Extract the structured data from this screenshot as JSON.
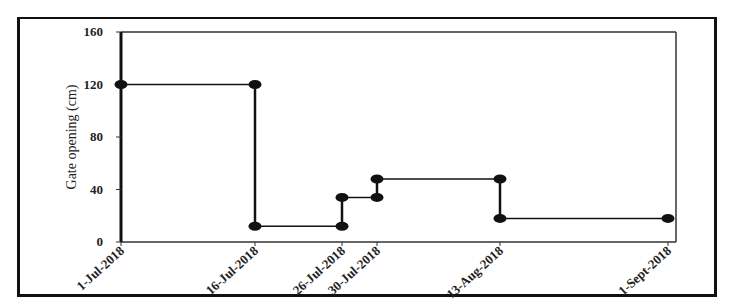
{
  "chart_data": {
    "type": "line",
    "subtype": "step",
    "title": "",
    "xlabel": "",
    "ylabel": "Gate opening (cm)",
    "ylim": [
      0,
      160
    ],
    "yticks": [
      0,
      40,
      80,
      120,
      160
    ],
    "categories": [
      "1-Jul-2018",
      "16-Jul-2018",
      "26-Jul-2018",
      "30-Jul-2018",
      "13-Aug-2018",
      "1-Sept-2018"
    ],
    "x_positions_days": [
      0,
      15,
      25,
      29,
      43,
      62
    ],
    "points": [
      {
        "x": "1-Jul-2018",
        "y": 120
      },
      {
        "x": "16-Jul-2018",
        "y": 120
      },
      {
        "x": "16-Jul-2018",
        "y": 12
      },
      {
        "x": "26-Jul-2018",
        "y": 12
      },
      {
        "x": "26-Jul-2018",
        "y": 34
      },
      {
        "x": "30-Jul-2018",
        "y": 34
      },
      {
        "x": "30-Jul-2018",
        "y": 48
      },
      {
        "x": "13-Aug-2018",
        "y": 48
      },
      {
        "x": "13-Aug-2018",
        "y": 18
      },
      {
        "x": "1-Sept-2018",
        "y": 18
      }
    ],
    "grid": false,
    "legend": null,
    "line_color": "#111111"
  }
}
